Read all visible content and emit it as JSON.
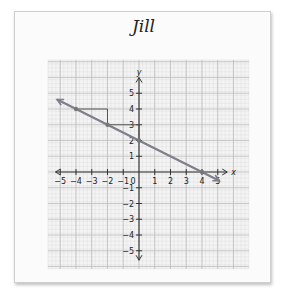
{
  "title": "Jill",
  "chart_data": {
    "type": "line",
    "title": "Jill",
    "xlabel": "x",
    "ylabel": "y",
    "xlim": [
      -5,
      5
    ],
    "ylim": [
      -5,
      5
    ],
    "x_ticks": [
      -5,
      -4,
      -3,
      -2,
      -1,
      0,
      1,
      2,
      3,
      4,
      5
    ],
    "y_ticks": [
      -5,
      -4,
      -3,
      -2,
      -1,
      1,
      2,
      3,
      4,
      5
    ],
    "grid": true,
    "series": [
      {
        "name": "line",
        "equation": "y = -1/2 x + 2",
        "slope": -0.5,
        "intercept": 2,
        "x": [
          -5.2,
          5.1
        ],
        "y": [
          4.6,
          -0.55
        ]
      }
    ],
    "points": [
      {
        "x": -4,
        "y": 4
      },
      {
        "x": -2,
        "y": 3
      },
      {
        "x": 0,
        "y": 2
      },
      {
        "x": 4,
        "y": 0
      }
    ],
    "slope_triangles": [
      {
        "from": [
          -4,
          4
        ],
        "run": 2,
        "rise": -1
      },
      {
        "from": [
          -2,
          3
        ],
        "run": 2,
        "rise": -1
      }
    ]
  }
}
